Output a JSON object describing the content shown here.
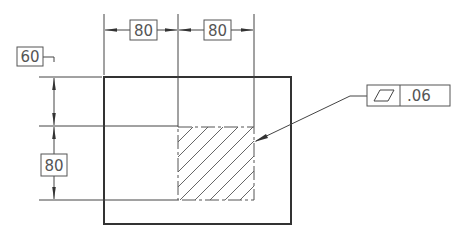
{
  "drawing": {
    "type": "engineering-drawing",
    "subject": "flatness tolerance on hatched area",
    "colors": {
      "outline": "#333333",
      "thin": "#444444",
      "text": "#555555",
      "hatch": "#666666",
      "background": "#ffffff"
    },
    "dimensions": {
      "top_left": {
        "value": "80",
        "orientation": "horizontal"
      },
      "top_right": {
        "value": "80",
        "orientation": "horizontal"
      },
      "left_upper": {
        "value": "60",
        "orientation": "vertical"
      },
      "left_lower": {
        "value": "80",
        "orientation": "vertical"
      }
    },
    "feature_control_frame": {
      "symbol": "flatness-icon",
      "symbol_glyph": "▱",
      "tolerance": ".06"
    }
  }
}
